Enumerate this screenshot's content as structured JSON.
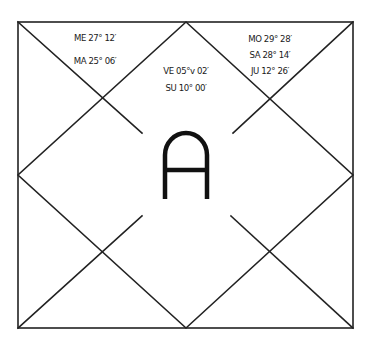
{
  "chart": {
    "type": "north-indian-kundli",
    "frame": {
      "x1": 18,
      "y1": 22,
      "x2": 353,
      "y2": 328
    },
    "center": {
      "x": 186,
      "y": 175
    },
    "line_color": "#222222",
    "center_letter": "A",
    "houses": [
      {
        "position": "top-left-triangle",
        "planets": [
          {
            "label": "ME 27° 12′",
            "x": 95,
            "y": 33
          },
          {
            "label": "MA 25° 06′",
            "x": 95,
            "y": 56
          }
        ]
      },
      {
        "position": "top-center-diamond",
        "planets": [
          {
            "label": "VE 05°v 02′",
            "x": 186,
            "y": 66
          },
          {
            "label": "SU 10° 00′",
            "x": 186,
            "y": 83
          }
        ]
      },
      {
        "position": "top-right-triangle",
        "planets": [
          {
            "label": "MO 29° 28′",
            "x": 270,
            "y": 34
          },
          {
            "label": "SA 28° 14′",
            "x": 270,
            "y": 50
          },
          {
            "label": "JU 12° 26′",
            "x": 270,
            "y": 66
          }
        ]
      }
    ]
  }
}
